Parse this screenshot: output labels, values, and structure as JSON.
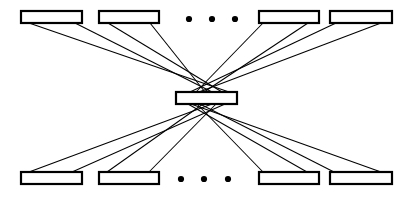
{
  "diagram": {
    "type": "node-link",
    "background_color": "#ffffff",
    "stroke_color": "#000000",
    "node_fill_color": "#ffffff",
    "canvas": {
      "width": 411,
      "height": 200
    },
    "node_style": {
      "shape": "rectangle",
      "border_width": 2.2,
      "width": 61,
      "height": 12
    },
    "link_style": {
      "width": 1.05,
      "color": "#000000"
    },
    "nodes": [
      {
        "id": "top-1",
        "label": "",
        "row": "top",
        "x": 21,
        "y": 11,
        "w": 61,
        "h": 12
      },
      {
        "id": "top-2",
        "label": "",
        "row": "top",
        "x": 99,
        "y": 11,
        "w": 60,
        "h": 12
      },
      {
        "id": "top-3",
        "label": "",
        "row": "top",
        "x": 259,
        "y": 11,
        "w": 60,
        "h": 12
      },
      {
        "id": "top-4",
        "label": "",
        "row": "top",
        "x": 330,
        "y": 11,
        "w": 62,
        "h": 12
      },
      {
        "id": "center",
        "label": "",
        "row": "center",
        "x": 176,
        "y": 92,
        "w": 61,
        "h": 12
      },
      {
        "id": "bottom-1",
        "label": "",
        "row": "bottom",
        "x": 21,
        "y": 172,
        "w": 61,
        "h": 12
      },
      {
        "id": "bottom-2",
        "label": "",
        "row": "bottom",
        "x": 99,
        "y": 172,
        "w": 60,
        "h": 12
      },
      {
        "id": "bottom-3",
        "label": "",
        "row": "bottom",
        "x": 259,
        "y": 172,
        "w": 60,
        "h": 12
      },
      {
        "id": "bottom-4",
        "label": "",
        "row": "bottom",
        "x": 330,
        "y": 172,
        "w": 62,
        "h": 12
      }
    ],
    "links": [
      {
        "from": "top-1",
        "to": "center",
        "x1": 29,
        "y1": 23,
        "x2": 229,
        "y2": 92
      },
      {
        "from": "top-1",
        "to": "center",
        "x1": 75,
        "y1": 23,
        "x2": 212,
        "y2": 92
      },
      {
        "from": "top-2",
        "to": "center",
        "x1": 108,
        "y1": 23,
        "x2": 222,
        "y2": 92
      },
      {
        "from": "top-2",
        "to": "center",
        "x1": 150,
        "y1": 23,
        "x2": 205,
        "y2": 92
      },
      {
        "from": "top-3",
        "to": "center",
        "x1": 263,
        "y1": 23,
        "x2": 196,
        "y2": 92
      },
      {
        "from": "top-3",
        "to": "center",
        "x1": 308,
        "y1": 23,
        "x2": 204,
        "y2": 92
      },
      {
        "from": "top-4",
        "to": "center",
        "x1": 336,
        "y1": 23,
        "x2": 190,
        "y2": 92
      },
      {
        "from": "top-4",
        "to": "center",
        "x1": 381,
        "y1": 23,
        "x2": 199,
        "y2": 92
      },
      {
        "from": "center",
        "to": "bottom-1",
        "x1": 212,
        "y1": 104,
        "x2": 29,
        "y2": 172
      },
      {
        "from": "center",
        "to": "bottom-1",
        "x1": 225,
        "y1": 104,
        "x2": 72,
        "y2": 172
      },
      {
        "from": "center",
        "to": "bottom-2",
        "x1": 203,
        "y1": 104,
        "x2": 107,
        "y2": 172
      },
      {
        "from": "center",
        "to": "bottom-2",
        "x1": 216,
        "y1": 104,
        "x2": 149,
        "y2": 172
      },
      {
        "from": "center",
        "to": "bottom-3",
        "x1": 197,
        "y1": 104,
        "x2": 263,
        "y2": 172
      },
      {
        "from": "center",
        "to": "bottom-3",
        "x1": 188,
        "y1": 104,
        "x2": 307,
        "y2": 172
      },
      {
        "from": "center",
        "to": "bottom-4",
        "x1": 200,
        "y1": 104,
        "x2": 334,
        "y2": 172
      },
      {
        "from": "center",
        "to": "bottom-4",
        "x1": 191,
        "y1": 104,
        "x2": 381,
        "y2": 172
      }
    ],
    "ellipses": [
      {
        "id": "top-ellipsis",
        "row": "top",
        "meaning": "more nodes omitted",
        "dot_radius": 3.1,
        "dots": [
          {
            "cx": 189,
            "cy": 19
          },
          {
            "cx": 212,
            "cy": 19
          },
          {
            "cx": 235,
            "cy": 19
          }
        ]
      },
      {
        "id": "bottom-ellipsis",
        "row": "bottom",
        "meaning": "more nodes omitted",
        "dot_radius": 3.1,
        "dots": [
          {
            "cx": 181,
            "cy": 179
          },
          {
            "cx": 204,
            "cy": 179
          },
          {
            "cx": 228,
            "cy": 179
          }
        ]
      }
    ]
  }
}
